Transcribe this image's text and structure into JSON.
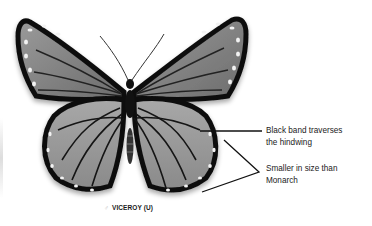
{
  "figure": {
    "caption": {
      "symbol": "♂",
      "text": "VICEROY (U)"
    },
    "annotations": [
      {
        "id": "band",
        "text_line1": "Black band traverses",
        "text_line2": "the hindwing"
      },
      {
        "id": "size",
        "text_line1": "Smaller in size than",
        "text_line2": "Monarch"
      }
    ],
    "colors": {
      "wing_fill": "#8a8a8a",
      "wing_border": "#111111",
      "spot": "#f2f2f2",
      "line": "#111111"
    }
  }
}
